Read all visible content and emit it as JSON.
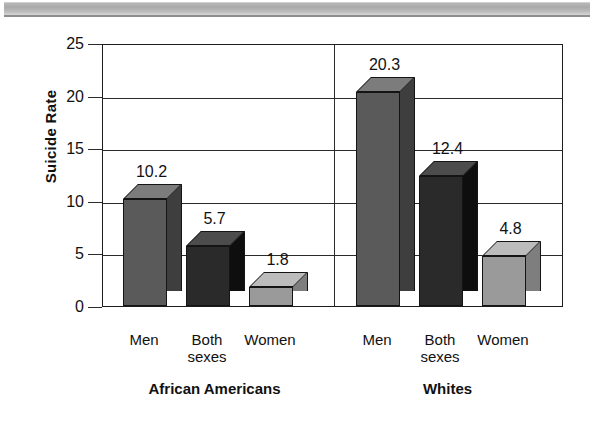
{
  "artifact": {
    "name": "scan-edge-bar"
  },
  "chart_data": {
    "type": "bar",
    "title": "",
    "subtitle": "",
    "xlabel": "",
    "ylabel": "Suicide Rate",
    "ylim": [
      0,
      25
    ],
    "ytick_labels": [
      "0",
      "5",
      "10",
      "15",
      "20",
      "25"
    ],
    "ytick_values": [
      0,
      5,
      10,
      15,
      20,
      25
    ],
    "grid": true,
    "grid_axis": "y",
    "legend": "none",
    "groups": [
      "African Americans",
      "Whites"
    ],
    "categories": [
      "Men",
      "Both sexes",
      "Women"
    ],
    "category_lines": [
      [
        "Men"
      ],
      [
        "Both",
        "sexes"
      ],
      [
        "Women"
      ]
    ],
    "series": [
      {
        "name": "African Americans",
        "values": [
          10.2,
          5.7,
          1.8
        ]
      },
      {
        "name": "Whites",
        "values": [
          20.3,
          12.4,
          4.8
        ]
      }
    ],
    "bars": [
      {
        "group": "African Americans",
        "category": "Men",
        "value": 10.2,
        "label": "10.2",
        "color": "#5a5a5a"
      },
      {
        "group": "African Americans",
        "category": "Both sexes",
        "value": 5.7,
        "label": "5.7",
        "color": "#2a2a2a"
      },
      {
        "group": "African Americans",
        "category": "Women",
        "value": 1.8,
        "label": "1.8",
        "color": "#9a9a9a"
      },
      {
        "group": "Whites",
        "category": "Men",
        "value": 20.3,
        "label": "20.3",
        "color": "#5a5a5a"
      },
      {
        "group": "Whites",
        "category": "Both sexes",
        "value": 12.4,
        "label": "12.4",
        "color": "#2a2a2a"
      },
      {
        "group": "Whites",
        "category": "Women",
        "value": 4.8,
        "label": "4.8",
        "color": "#9a9a9a"
      }
    ],
    "colors": {
      "men": "#5a5a5a",
      "both_sexes": "#2a2a2a",
      "women": "#9a9a9a",
      "axis": "#1c1c1c",
      "background": "#ffffff"
    }
  }
}
